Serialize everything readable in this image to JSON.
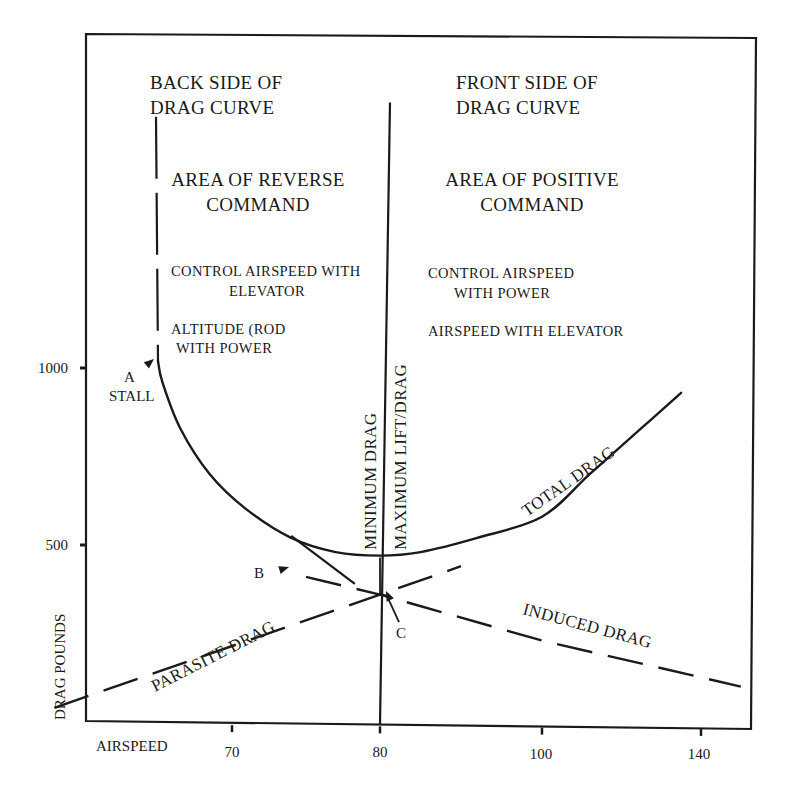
{
  "chart_data": {
    "type": "line",
    "title": "",
    "xlabel": "AIRSPEED",
    "ylabel": "DRAG POUNDS",
    "x_ticks": [
      70,
      80,
      100,
      140
    ],
    "x_tick_labels": [
      "70",
      "80",
      "100",
      "140"
    ],
    "y_ticks": [
      500,
      1000
    ],
    "y_tick_labels": [
      "500",
      "1000"
    ],
    "ylim": [
      0,
      1000
    ],
    "xlim": [
      70,
      140
    ],
    "grid": false,
    "legend": "none",
    "series": [
      {
        "name": "TOTAL DRAG",
        "style": "solid",
        "points": [
          [
            65,
            1020
          ],
          [
            65.3,
            960
          ],
          [
            66.5,
            830
          ],
          [
            68.5,
            700
          ],
          [
            71,
            600
          ],
          [
            74,
            520
          ],
          [
            77,
            480
          ],
          [
            80,
            470
          ],
          [
            85,
            480
          ],
          [
            92,
            520
          ],
          [
            100,
            580
          ],
          [
            112,
            700
          ],
          [
            125,
            830
          ],
          [
            135,
            930
          ]
        ]
      },
      {
        "name": "PARASITE DRAG",
        "style": "dashed",
        "points": [
          [
            58,
            40
          ],
          [
            80,
            360
          ],
          [
            90,
            440
          ]
        ]
      },
      {
        "name": "INDUCED DRAG",
        "style": "dashed",
        "points": [
          [
            75,
            410
          ],
          [
            80,
            360
          ],
          [
            100,
            230
          ],
          [
            150,
            100
          ]
        ]
      },
      {
        "name": "MINIMUM DRAG / MAXIMUM LIFT/DRAG",
        "style": "vertical",
        "x": 80,
        "ylim": [
          0,
          1750
        ]
      },
      {
        "name": "STALL BOUNDARY",
        "style": "dashed-vertical",
        "x": 65,
        "ylim": [
          1020,
          1710
        ]
      }
    ],
    "annotations": [
      {
        "label": "A",
        "text": "STALL",
        "x": 65,
        "y": 1020
      },
      {
        "label": "B",
        "x": 74.5,
        "y": 520
      },
      {
        "label": "C",
        "x": 80.5,
        "y": 360
      }
    ],
    "regions": {
      "back": {
        "heading": [
          "BACK SIDE OF",
          "DRAG CURVE"
        ],
        "area": [
          "AREA OF REVERSE",
          "COMMAND"
        ],
        "note1": [
          "CONTROL AIRSPEED WITH",
          "ELEVATOR"
        ],
        "note2": [
          "ALTITUDE (ROD",
          "WITH POWER"
        ]
      },
      "front": {
        "heading": [
          "FRONT SIDE OF",
          "DRAG CURVE"
        ],
        "area": [
          "AREA OF POSITIVE",
          "COMMAND"
        ],
        "note1": [
          "CONTROL AIRSPEED",
          "WITH POWER"
        ],
        "note2": [
          "AIRSPEED WITH ELEVATOR"
        ]
      }
    },
    "vertical_line_labels": [
      "MINIMUM DRAG",
      "MAXIMUM LIFT/DRAG"
    ],
    "curve_labels": {
      "total": "TOTAL DRAG",
      "parasite": "PARASITE DRAG",
      "induced": "INDUCED DRAG"
    }
  }
}
